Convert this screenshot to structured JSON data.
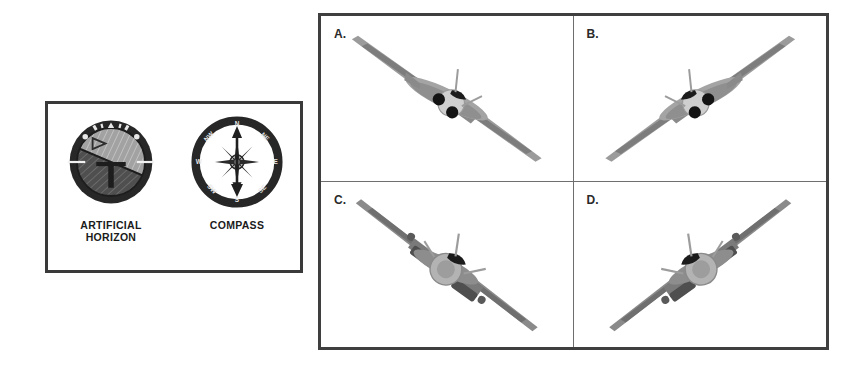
{
  "background_color": "#ffffff",
  "instrument_panel": {
    "name": "flight-instruments",
    "border_color": "#3a3a3a",
    "instruments": [
      {
        "icon": "artificial-horizon-icon",
        "caption_line1": "ARTIFICIAL",
        "caption_line2": "HORIZON",
        "bezel_color": "#2b2b2b",
        "sky_color": "#9a9a9a",
        "ground_color": "#4a4a4a",
        "bank_angle_degrees": 23
      },
      {
        "icon": "compass-icon",
        "caption_line1": "COMPASS",
        "caption_line2": "",
        "bezel_color": "#2b2b2b",
        "face_color": "#ffffff",
        "needle_color": "#1f1f1f",
        "cardinal_points": [
          "N",
          "NE",
          "E",
          "SE",
          "S",
          "SW",
          "W",
          "NW"
        ],
        "heading_label": "N"
      }
    ]
  },
  "aircraft_grid": {
    "name": "aircraft-answer-choices",
    "border_color": "#3f3f3f",
    "divider_color": "#6e6e6e",
    "columns": 2,
    "rows": 2,
    "cells": [
      {
        "label": "A.",
        "icon": "jet-aircraft-icon",
        "aircraft_type": "swept-wing-jet",
        "bank_direction": "right-wing-down",
        "wing_tilt_degrees": 26,
        "body_color": "#8d8d8d",
        "accent_color": "#2a2a2a"
      },
      {
        "label": "B.",
        "icon": "jet-aircraft-icon",
        "aircraft_type": "swept-wing-jet",
        "bank_direction": "left-wing-down",
        "wing_tilt_degrees": -26,
        "body_color": "#8d8d8d",
        "accent_color": "#2a2a2a"
      },
      {
        "label": "C.",
        "icon": "jet-aircraft-pods-icon",
        "aircraft_type": "podded-wing-jet",
        "bank_direction": "right-wing-down",
        "wing_tilt_degrees": 26,
        "body_color": "#7e7e7e",
        "accent_color": "#2a2a2a"
      },
      {
        "label": "D.",
        "icon": "jet-aircraft-pods-icon",
        "aircraft_type": "podded-wing-jet",
        "bank_direction": "left-wing-down",
        "wing_tilt_degrees": -26,
        "body_color": "#7e7e7e",
        "accent_color": "#2a2a2a"
      }
    ]
  }
}
